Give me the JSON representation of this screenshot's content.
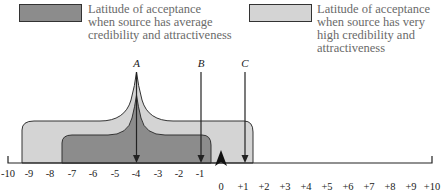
{
  "legend": [
    {
      "label_lines": [
        "Latitude of acceptance",
        "when source has average",
        "credibility and attractiveness"
      ],
      "color": "#8c8c8c"
    },
    {
      "label_lines": [
        "Latitude of acceptance",
        "when source has very",
        "high credibility and",
        "attractiveness"
      ],
      "color": "#d4d4d4"
    }
  ],
  "markers": [
    {
      "label": "A",
      "value": -4
    },
    {
      "label": "B",
      "value": -1
    },
    {
      "label": "C",
      "value": 1
    }
  ],
  "axis": {
    "negative_ticks": [
      "-10",
      "-9",
      "-8",
      "-7",
      "-6",
      "-5",
      "-4",
      "-3",
      "-2",
      "-1"
    ],
    "positive_ticks": [
      "0",
      "+1",
      "+2",
      "+3",
      "+4",
      "+5",
      "+6",
      "+7",
      "+8",
      "+9",
      "+10"
    ]
  },
  "colors": {
    "dark_region": "#8c8c8c",
    "light_region": "#d4d4d4",
    "outline": "#333333"
  }
}
